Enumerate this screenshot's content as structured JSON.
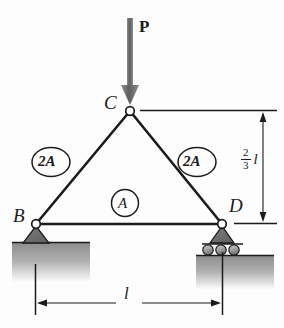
{
  "figure": {
    "type": "truss-free-body-diagram",
    "nodes": [
      {
        "id": "B",
        "label": "B",
        "x": 36,
        "y": 224,
        "support": "pin"
      },
      {
        "id": "C",
        "label": "C",
        "x": 130,
        "y": 111,
        "support": "none"
      },
      {
        "id": "D",
        "label": "D",
        "x": 222,
        "y": 224,
        "support": "roller"
      }
    ],
    "members": [
      {
        "id": "BC",
        "label": "2A",
        "from": "B",
        "to": "C",
        "area": "2A"
      },
      {
        "id": "CD",
        "label": "2A",
        "from": "C",
        "to": "D",
        "area": "2A"
      },
      {
        "id": "BD",
        "label": "A",
        "from": "B",
        "to": "D",
        "area": "A"
      }
    ],
    "load": {
      "label": "P",
      "direction": "down",
      "applied_at": "C"
    },
    "dimensions": [
      {
        "id": "height",
        "numerator": "2",
        "denominator": "3",
        "symbol": "l",
        "orientation": "vertical",
        "text": "2/3 l"
      },
      {
        "id": "span",
        "symbol": "l",
        "orientation": "horizontal",
        "text": "l"
      }
    ],
    "colors": {
      "line": "#1b1b1b",
      "load_arrow": "#6e6e6e",
      "support_fill": "#8a8a8a",
      "ground_fill": "#a7a7a7",
      "node_fill": "#ffffff",
      "background": "#fdfdfd"
    }
  }
}
